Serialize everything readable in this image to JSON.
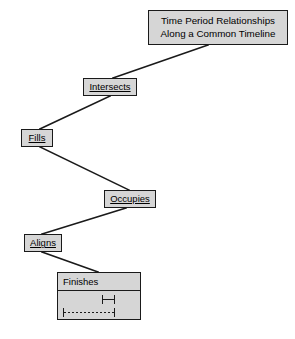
{
  "diagram": {
    "type": "hierarchy-zigzag",
    "title": "Time Period Relationships Along a Common Timeline",
    "colors": {
      "node_fill": "#d6d6d6",
      "node_border": "#1a1a1a",
      "connector": "#1a1a1a",
      "background": "#ffffff",
      "text": "#000000"
    },
    "root": {
      "line1": "Time Period Relationships",
      "line2": "Along a Common Timeline"
    },
    "nodes": [
      {
        "id": "intersects",
        "label": "Intersects",
        "underlined": true
      },
      {
        "id": "fills",
        "label": "Fills",
        "underlined": true
      },
      {
        "id": "occupies",
        "label": "Occupies",
        "underlined": true
      },
      {
        "id": "aligns",
        "label": "Aligns",
        "underlined": true
      }
    ],
    "expanded_node": {
      "id": "finishes",
      "title": "Finishes",
      "underlined": false,
      "timeline": {
        "description": "Two time periods ending at the same instant",
        "bars": [
          {
            "id": "bar-upper",
            "style": "solid",
            "glyph": "|-|"
          },
          {
            "id": "bar-lower",
            "style": "dashed",
            "glyph": "|----------|"
          }
        ]
      }
    },
    "connectors": [
      {
        "from": "root",
        "to": "intersects"
      },
      {
        "from": "intersects",
        "to": "fills"
      },
      {
        "from": "fills",
        "to": "occupies"
      },
      {
        "from": "occupies",
        "to": "aligns"
      },
      {
        "from": "aligns",
        "to": "finishes"
      }
    ]
  }
}
